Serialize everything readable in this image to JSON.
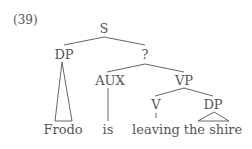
{
  "example_number": "(39)",
  "tree": {
    "root": "S",
    "dp_subject": "DP",
    "unknown_node": "?",
    "aux": "AUX",
    "vp": "VP",
    "v": "V",
    "dp_object": "DP"
  },
  "leaves": {
    "frodo": "Frodo",
    "is": "is",
    "leaving": "leaving",
    "the_shire": "the shire"
  }
}
